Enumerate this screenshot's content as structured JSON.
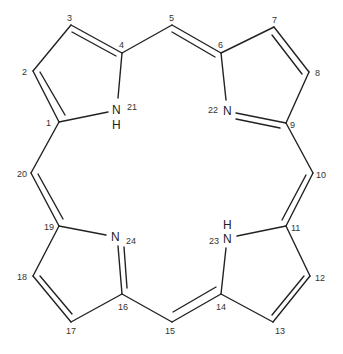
{
  "diagram": {
    "type": "chemical-structure",
    "molecule": "porphyrin",
    "atoms": [
      {
        "id": "1",
        "label": "1",
        "x": 59,
        "y": 122
      },
      {
        "id": "2",
        "label": "2",
        "x": 33,
        "y": 71
      },
      {
        "id": "3",
        "label": "3",
        "x": 71,
        "y": 25
      },
      {
        "id": "4",
        "label": "4",
        "x": 122,
        "y": 53
      },
      {
        "id": "5",
        "label": "5",
        "x": 172,
        "y": 25
      },
      {
        "id": "6",
        "label": "6",
        "x": 221,
        "y": 53
      },
      {
        "id": "7",
        "label": "7",
        "x": 274,
        "y": 27
      },
      {
        "id": "8",
        "label": "8",
        "x": 309,
        "y": 72
      },
      {
        "id": "9",
        "label": "9",
        "x": 286,
        "y": 123
      },
      {
        "id": "10",
        "label": "10",
        "x": 313,
        "y": 173
      },
      {
        "id": "11",
        "label": "11",
        "x": 286,
        "y": 226
      },
      {
        "id": "12",
        "label": "12",
        "x": 310,
        "y": 276
      },
      {
        "id": "13",
        "label": "13",
        "x": 273,
        "y": 322
      },
      {
        "id": "14",
        "label": "14",
        "x": 221,
        "y": 294
      },
      {
        "id": "15",
        "label": "15",
        "x": 172,
        "y": 322
      },
      {
        "id": "16",
        "label": "16",
        "x": 122,
        "y": 294
      },
      {
        "id": "17",
        "label": "17",
        "x": 71,
        "y": 322
      },
      {
        "id": "18",
        "label": "18",
        "x": 33,
        "y": 276
      },
      {
        "id": "19",
        "label": "19",
        "x": 59,
        "y": 226
      },
      {
        "id": "20",
        "label": "20",
        "x": 31,
        "y": 173
      },
      {
        "id": "21",
        "label": "21",
        "element": "N",
        "hydrogen": "H",
        "x": 117,
        "y": 108
      },
      {
        "id": "22",
        "label": "22",
        "element": "N",
        "x": 228,
        "y": 110
      },
      {
        "id": "23",
        "label": "23",
        "element": "N",
        "hydrogen": "H",
        "x": 228,
        "y": 238
      },
      {
        "id": "24",
        "label": "24",
        "element": "N",
        "x": 116,
        "y": 236
      }
    ],
    "labels": {
      "n": "N",
      "h": "H",
      "l1": "1",
      "l2": "2",
      "l3": "3",
      "l4": "4",
      "l5": "5",
      "l6": "6",
      "l7": "7",
      "l8": "8",
      "l9": "9",
      "l10": "10",
      "l11": "11",
      "l12": "12",
      "l13": "13",
      "l14": "14",
      "l15": "15",
      "l16": "16",
      "l17": "17",
      "l18": "18",
      "l19": "19",
      "l20": "20",
      "l21": "21",
      "l22": "22",
      "l23": "23",
      "l24": "24"
    },
    "bonds": [
      {
        "from": "1",
        "to": "2",
        "order": 2
      },
      {
        "from": "2",
        "to": "3",
        "order": 1
      },
      {
        "from": "3",
        "to": "4",
        "order": 2
      },
      {
        "from": "4",
        "to": "21",
        "order": 1
      },
      {
        "from": "21",
        "to": "1",
        "order": 1
      },
      {
        "from": "4",
        "to": "5",
        "order": 1
      },
      {
        "from": "5",
        "to": "6",
        "order": 2
      },
      {
        "from": "6",
        "to": "7",
        "order": 1
      },
      {
        "from": "7",
        "to": "8",
        "order": 2
      },
      {
        "from": "8",
        "to": "9",
        "order": 1
      },
      {
        "from": "9",
        "to": "22",
        "order": 2
      },
      {
        "from": "22",
        "to": "6",
        "order": 1
      },
      {
        "from": "9",
        "to": "10",
        "order": 1
      },
      {
        "from": "10",
        "to": "11",
        "order": 2
      },
      {
        "from": "11",
        "to": "12",
        "order": 1
      },
      {
        "from": "12",
        "to": "13",
        "order": 2
      },
      {
        "from": "13",
        "to": "14",
        "order": 1
      },
      {
        "from": "14",
        "to": "23",
        "order": 1
      },
      {
        "from": "23",
        "to": "11",
        "order": 1
      },
      {
        "from": "14",
        "to": "15",
        "order": 2
      },
      {
        "from": "15",
        "to": "16",
        "order": 1
      },
      {
        "from": "16",
        "to": "24",
        "order": 2
      },
      {
        "from": "24",
        "to": "19",
        "order": 1
      },
      {
        "from": "16",
        "to": "17",
        "order": 1
      },
      {
        "from": "17",
        "to": "18",
        "order": 2
      },
      {
        "from": "18",
        "to": "19",
        "order": 1
      },
      {
        "from": "19",
        "to": "20",
        "order": 2
      },
      {
        "from": "20",
        "to": "1",
        "order": 1
      }
    ],
    "colors": {
      "stroke": "#222222",
      "background": "#ffffff"
    }
  }
}
